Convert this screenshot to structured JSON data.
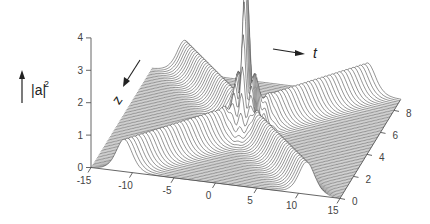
{
  "chart_data": {
    "type": "surface-3d",
    "title": "",
    "zlabel": "|a|^2",
    "xlabel": "t",
    "ylabel": "z",
    "x_axis": {
      "name": "t",
      "range": [
        -15,
        15
      ],
      "ticks": [
        -15,
        -10,
        -5,
        0,
        5,
        10,
        15
      ],
      "tick_labels": [
        "-15",
        "-10",
        "-5",
        "0",
        "5",
        "10",
        "15"
      ]
    },
    "y_axis": {
      "name": "z",
      "range": [
        0,
        9
      ],
      "ticks": [
        0,
        2,
        4,
        6,
        8
      ],
      "tick_labels": [
        "0",
        "2",
        "4",
        "6",
        "8"
      ]
    },
    "z_axis": {
      "name": "|a|^2",
      "range": [
        0,
        4
      ],
      "ticks": [
        0,
        1,
        2,
        3,
        4
      ],
      "tick_labels": [
        "0",
        "1",
        "2",
        "3",
        "4"
      ]
    },
    "series": [
      {
        "name": "soliton-1",
        "amplitude": 1.0,
        "t_start": -11,
        "t_end": 11
      },
      {
        "name": "soliton-2",
        "amplitude": 1.0,
        "t_start": 11,
        "t_end": -11
      },
      {
        "name": "collision-peak",
        "t": 0,
        "z": 4.5,
        "peak_value": 4.1
      }
    ],
    "arrows": [
      {
        "name": "z-direction-arrow",
        "label": "z"
      },
      {
        "name": "t-direction-arrow",
        "label": "t"
      },
      {
        "name": "amplitude-arrow",
        "label": "|a|",
        "superscript": "2"
      }
    ],
    "grid": false,
    "legend": "none"
  },
  "labels": {
    "amp_base": "|a|",
    "amp_sup": "2",
    "t": "t",
    "z": "z"
  }
}
